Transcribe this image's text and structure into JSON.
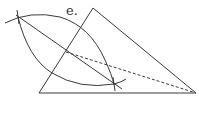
{
  "label": "e.",
  "colors": {
    "stroke": "#3a3a3a",
    "background": "#ffffff"
  },
  "triangle": {
    "points": [
      [
        39,
        93
      ],
      [
        93,
        8
      ],
      [
        196,
        93
      ]
    ]
  },
  "bisector": {
    "from": [
      16,
      15
    ],
    "to": [
      122,
      89
    ]
  },
  "dashed_line": {
    "from": [
      66,
      52
    ],
    "to": [
      196,
      93
    ]
  },
  "arc_upper": "M 5 23 Q 30 10 60 17 Q 90 26 105 60 Q 112 75 114 85",
  "arc_lower": "M 18 17 Q 28 58 52 73 Q 80 90 114 84 Q 122 82 126 79",
  "cross_marks": [
    [
      18,
      17
    ],
    [
      114,
      84
    ]
  ]
}
